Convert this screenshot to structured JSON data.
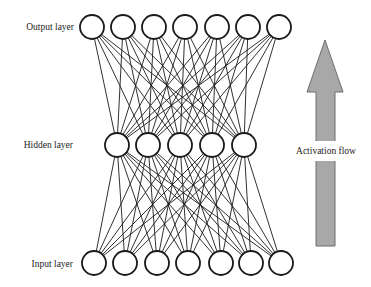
{
  "diagram": {
    "type": "neural-network",
    "layers": [
      {
        "id": "output",
        "label": "Output layer",
        "nodes": 7,
        "y": 27,
        "x": [
          92,
          123,
          154,
          185,
          217,
          248,
          279
        ]
      },
      {
        "id": "hidden",
        "label": "Hidden layer",
        "nodes": 5,
        "y": 145,
        "x": [
          117,
          148,
          180,
          212,
          244
        ]
      },
      {
        "id": "input",
        "label": "Input layer",
        "nodes": 7,
        "y": 263,
        "x": [
          94,
          125,
          157,
          188,
          221,
          251,
          281
        ]
      }
    ],
    "node_radius": 12,
    "connections": [
      {
        "from": "input",
        "to": "hidden",
        "type": "fully-connected"
      },
      {
        "from": "hidden",
        "to": "output",
        "type": "fully-connected"
      }
    ],
    "arrow": {
      "label": "Activation flow",
      "direction": "up",
      "fill": "#a8a8a8",
      "stroke": "#6e6e6e"
    }
  }
}
